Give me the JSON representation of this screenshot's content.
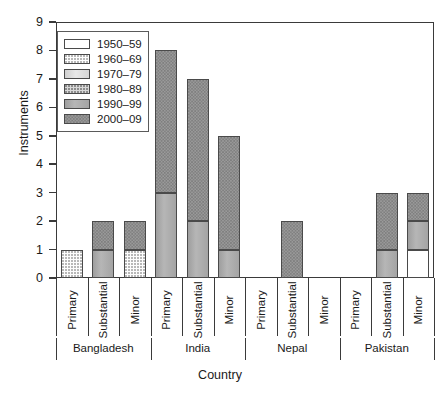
{
  "chart_data": {
    "type": "bar",
    "stacked": true,
    "title": "",
    "xlabel": "Country",
    "ylabel": "Instruments",
    "ylim": [
      0,
      9
    ],
    "yticks": [
      "0",
      "1",
      "2",
      "3",
      "4",
      "5",
      "6",
      "7",
      "8",
      "9"
    ],
    "grid": false,
    "legend_position": "top-left-inside",
    "series": [
      {
        "name": "1950–59",
        "key": "1950",
        "values": [
          0,
          0,
          0,
          0,
          0,
          0,
          0,
          0,
          0,
          0,
          0,
          1
        ]
      },
      {
        "name": "1960–69",
        "key": "1960",
        "values": [
          1,
          0,
          1,
          0,
          0,
          0,
          0,
          0,
          0,
          0,
          0,
          0
        ]
      },
      {
        "name": "1970–79",
        "key": "1970",
        "values": [
          0,
          0,
          0,
          0,
          0,
          0,
          0,
          0,
          0,
          0,
          0,
          0
        ]
      },
      {
        "name": "1980–89",
        "key": "1980",
        "values": [
          0,
          0,
          0,
          0,
          0,
          0,
          0,
          0,
          0,
          0,
          0,
          0
        ]
      },
      {
        "name": "1990–99",
        "key": "1990",
        "values": [
          0,
          1,
          0,
          3,
          2,
          1,
          0,
          0,
          0,
          0,
          1,
          1
        ]
      },
      {
        "name": "2000–09",
        "key": "2000",
        "values": [
          0,
          1,
          1,
          5,
          5,
          4,
          0,
          2,
          0,
          0,
          2,
          1
        ]
      }
    ],
    "categories": [
      "Primary",
      "Substantial",
      "Minor",
      "Primary",
      "Substantial",
      "Minor",
      "Primary",
      "Substantial",
      "Minor",
      "Primary",
      "Substantial",
      "Minor"
    ],
    "groups": [
      {
        "label": "Bangladesh",
        "count": 3
      },
      {
        "label": "India",
        "count": 3
      },
      {
        "label": "Nepal",
        "count": 3
      },
      {
        "label": "Pakistan",
        "count": 3
      }
    ],
    "totals": [
      1,
      2,
      2,
      8,
      7,
      5,
      0,
      2,
      0,
      0,
      3,
      3
    ],
    "colors": {
      "1950": "#ffffff",
      "1960": "#fdfdfd",
      "1970": "#dedede",
      "1980": "#d8d8d8",
      "1990": "#ababab",
      "2000": "#9a9a9a",
      "axis": "#3a3a3a",
      "outline": "#4a4a4a",
      "text": "#1a1a1a",
      "background": "#ffffff"
    }
  }
}
